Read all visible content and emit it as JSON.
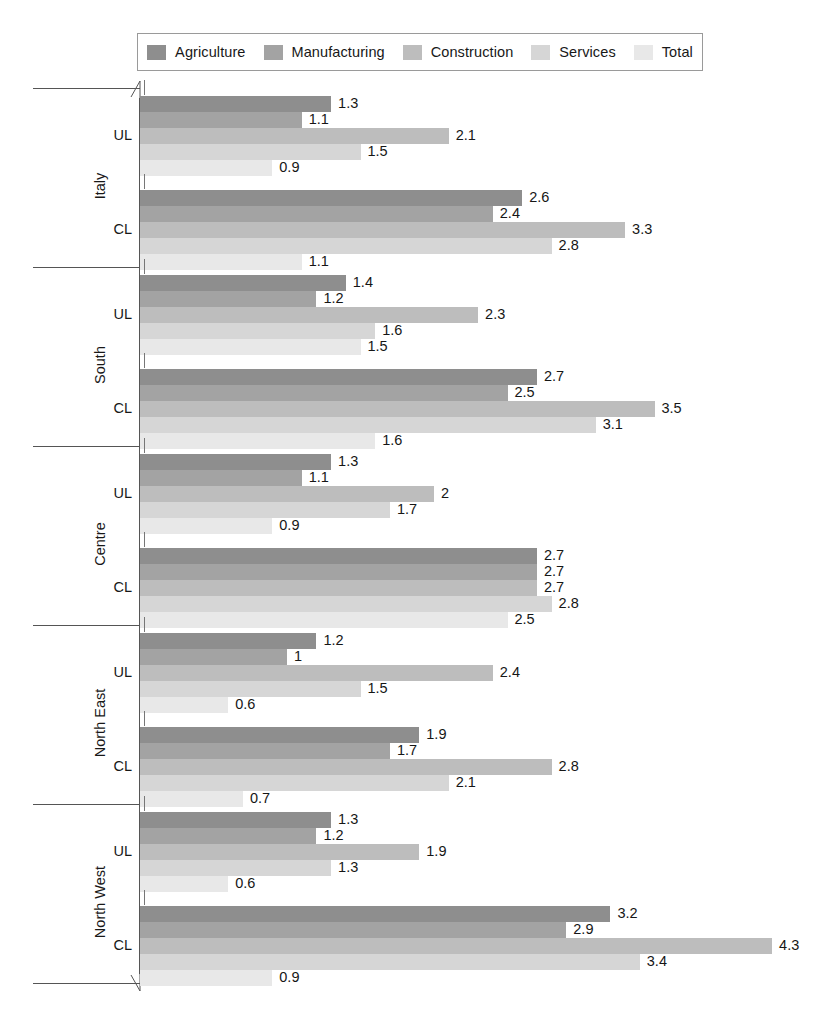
{
  "legend": {
    "entries": [
      {
        "label": "Agriculture",
        "color": "#8e8e8e"
      },
      {
        "label": "Manufacturing",
        "color": "#a3a3a3"
      },
      {
        "label": "Construction",
        "color": "#bdbdbd"
      },
      {
        "label": "Services",
        "color": "#d6d6d6"
      },
      {
        "label": "Total",
        "color": "#e8e8e8"
      }
    ]
  },
  "axis": {
    "sub_labels": [
      "UL",
      "CL"
    ],
    "break_marker": "axis-break-diagonal"
  },
  "chart_data": {
    "type": "bar",
    "orientation": "horizontal",
    "title": "",
    "xlabel": "",
    "ylabel": "",
    "xlim": [
      0,
      4.6
    ],
    "grid": false,
    "legend_position": "top",
    "series": [
      {
        "name": "Agriculture",
        "color": "#8e8e8e"
      },
      {
        "name": "Manufacturing",
        "color": "#a3a3a3"
      },
      {
        "name": "Construction",
        "color": "#bdbdbd"
      },
      {
        "name": "Services",
        "color": "#d6d6d6"
      },
      {
        "name": "Total",
        "color": "#e8e8e8"
      }
    ],
    "groups": [
      {
        "region": "Italy",
        "subgroups": [
          {
            "label": "UL",
            "values": [
              1.3,
              1.1,
              2.1,
              1.5,
              0.9
            ],
            "labels": [
              "1.3",
              "1.1",
              "2.1",
              "1.5",
              "0.9"
            ]
          },
          {
            "label": "CL",
            "values": [
              2.6,
              2.4,
              3.3,
              2.8,
              1.1
            ],
            "labels": [
              "2.6",
              "2.4",
              "3.3",
              "2.8",
              "1.1"
            ]
          }
        ]
      },
      {
        "region": "South",
        "subgroups": [
          {
            "label": "UL",
            "values": [
              1.4,
              1.2,
              2.3,
              1.6,
              1.5
            ],
            "labels": [
              "1.4",
              "1.2",
              "2.3",
              "1.6",
              "1.5"
            ]
          },
          {
            "label": "CL",
            "values": [
              2.7,
              2.5,
              3.5,
              3.1,
              1.6
            ],
            "labels": [
              "2.7",
              "2.5",
              "3.5",
              "3.1",
              "1.6"
            ]
          }
        ]
      },
      {
        "region": "Centre",
        "subgroups": [
          {
            "label": "UL",
            "values": [
              1.3,
              1.1,
              2.0,
              1.7,
              0.9
            ],
            "labels": [
              "1.3",
              "1.1",
              "2",
              "1.7",
              "0.9"
            ]
          },
          {
            "label": "CL",
            "values": [
              2.7,
              2.7,
              2.7,
              2.8,
              2.5
            ],
            "labels": [
              "2.7",
              "2.7",
              "2.7",
              "2.8",
              "2.5"
            ]
          }
        ]
      },
      {
        "region": "North East",
        "subgroups": [
          {
            "label": "UL",
            "values": [
              1.2,
              1.0,
              2.4,
              1.5,
              0.6
            ],
            "labels": [
              "1.2",
              "1",
              "2.4",
              "1.5",
              "0.6"
            ]
          },
          {
            "label": "CL",
            "values": [
              1.9,
              1.7,
              2.8,
              2.1,
              0.7
            ],
            "labels": [
              "1.9",
              "1.7",
              "2.8",
              "2.1",
              "0.7"
            ]
          }
        ]
      },
      {
        "region": "North West",
        "subgroups": [
          {
            "label": "UL",
            "values": [
              1.3,
              1.2,
              1.9,
              1.3,
              0.6
            ],
            "labels": [
              "1.3",
              "1.2",
              "1.9",
              "1.3",
              "0.6"
            ]
          },
          {
            "label": "CL",
            "values": [
              3.2,
              2.9,
              4.3,
              3.4,
              0.9
            ],
            "labels": [
              "3.2",
              "2.9",
              "4.3",
              "3.4",
              "0.9"
            ]
          }
        ]
      }
    ]
  }
}
